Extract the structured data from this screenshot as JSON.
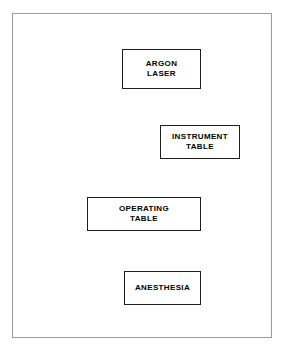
{
  "diagram": {
    "type": "floor-plan",
    "title": "",
    "frame": {
      "name": "operating-room-outline",
      "border_color": "#9a9a9a",
      "fill_color": "#ffffff"
    },
    "style": {
      "box_border_color": "#1d1d1d",
      "box_fill_color": "#ffffff",
      "label_color": "#000000",
      "background_color": "#ffffff"
    },
    "boxes": [
      {
        "id": "argon-laser",
        "label": "ARGON\nLASER",
        "line1": "ARGON",
        "line2": "LASER"
      },
      {
        "id": "instrument-table",
        "label": "INSTRUMENT\nTABLE",
        "line1": "INSTRUMENT",
        "line2": "TABLE"
      },
      {
        "id": "operating-table",
        "label": "OPERATING\nTABLE",
        "line1": "OPERATING",
        "line2": "TABLE"
      },
      {
        "id": "anesthesia",
        "label": "ANESTHESIA",
        "line1": "ANESTHESIA",
        "line2": ""
      }
    ]
  }
}
